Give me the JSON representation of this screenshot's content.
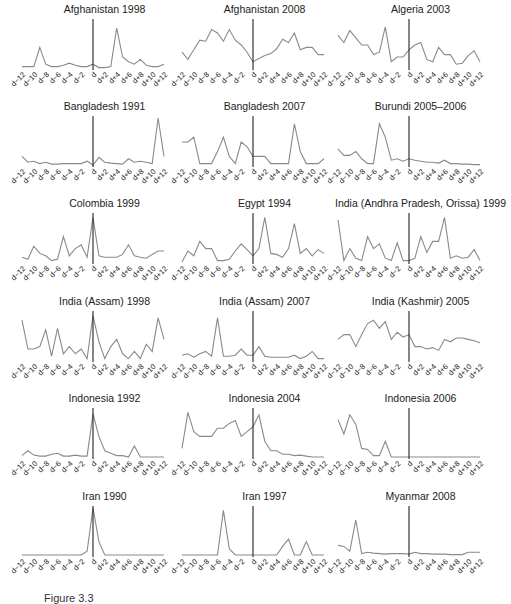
{
  "figure": {
    "caption": "Figure 3.3"
  },
  "x_tick_labels": [
    "d−12",
    "d−10",
    "d−8",
    "d−6",
    "d−4",
    "d−2",
    "d",
    "d+2",
    "d+4",
    "d+6",
    "d+8",
    "d+10",
    "d+12"
  ],
  "colors": {
    "line": "#8a8a8a",
    "event_line": "#222222",
    "text": "#222222"
  },
  "chart_data": [
    {
      "type": "line",
      "title": "Afghanistan 1998",
      "x": [
        "d-12",
        "d-11",
        "d-10",
        "d-9",
        "d-8",
        "d-7",
        "d-6",
        "d-5",
        "d-4",
        "d-3",
        "d-2",
        "d-1",
        "d",
        "d+1",
        "d+2",
        "d+3",
        "d+4",
        "d+5",
        "d+6",
        "d+7",
        "d+8",
        "d+9",
        "d+10",
        "d+11",
        "d+12"
      ],
      "values": [
        0.05,
        0.05,
        0.05,
        0.45,
        0.1,
        0.05,
        0.05,
        0.08,
        0.12,
        0.08,
        0.05,
        0.05,
        0.1,
        0.03,
        0.03,
        0.05,
        0.85,
        0.25,
        0.15,
        0.1,
        0.2,
        0.08,
        0.05,
        0.05,
        0.1
      ],
      "grid": false,
      "event_marker": "d"
    },
    {
      "type": "line",
      "title": "Afghanistan 2008",
      "x": [
        "d-12",
        "d+12"
      ],
      "values": [
        0.35,
        0.2,
        0.4,
        0.6,
        0.58,
        0.82,
        0.75,
        0.58,
        0.82,
        0.6,
        0.5,
        0.35,
        0.15,
        0.22,
        0.28,
        0.32,
        0.42,
        0.62,
        0.55,
        0.75,
        0.4,
        0.45,
        0.45,
        0.3,
        0.3
      ],
      "grid": false,
      "event_marker": "d"
    },
    {
      "type": "line",
      "title": "Algeria 2003",
      "x": [
        "d-12",
        "d+12"
      ],
      "values": [
        0.7,
        0.55,
        0.8,
        0.65,
        0.5,
        0.5,
        0.3,
        0.35,
        0.88,
        0.15,
        0.25,
        0.25,
        0.4,
        0.5,
        0.55,
        0.2,
        0.15,
        0.45,
        0.3,
        0.3,
        0.1,
        0.12,
        0.28,
        0.38,
        0.15
      ],
      "grid": false,
      "event_marker": "d"
    },
    {
      "type": "line",
      "title": "Bangladesh 1991",
      "x": [
        "d-12",
        "d+12"
      ],
      "values": [
        0.2,
        0.08,
        0.1,
        0.05,
        0.08,
        0.04,
        0.04,
        0.05,
        0.05,
        0.05,
        0.05,
        0.1,
        0.02,
        0.18,
        0.08,
        0.06,
        0.05,
        0.04,
        0.15,
        0.08,
        0.1,
        0.08,
        0.05,
        1.0,
        0.2
      ],
      "grid": false,
      "event_marker": "d"
    },
    {
      "type": "line",
      "title": "Bangladesh 2007",
      "x": [
        "d-12",
        "d+12"
      ],
      "values": [
        0.5,
        0.5,
        0.6,
        0.05,
        0.05,
        0.05,
        0.3,
        0.6,
        0.2,
        0.05,
        0.5,
        0.4,
        0.2,
        0.2,
        0.2,
        0.05,
        0.05,
        0.05,
        0.05,
        0.88,
        0.3,
        0.05,
        0.05,
        0.05,
        0.15
      ],
      "grid": false,
      "event_marker": "d"
    },
    {
      "type": "line",
      "title": "Burundi 2005–2006",
      "x": [
        "d-12",
        "d+12"
      ],
      "values": [
        0.35,
        0.22,
        0.22,
        0.3,
        0.15,
        0.05,
        0.05,
        0.88,
        0.6,
        0.12,
        0.15,
        0.1,
        0.15,
        0.12,
        0.1,
        0.08,
        0.08,
        0.06,
        0.12,
        0.05,
        0.05,
        0.04,
        0.04,
        0.03,
        0.03
      ],
      "grid": false,
      "event_marker": "d"
    },
    {
      "type": "line",
      "title": "Colombia 1999",
      "x": [
        "d-12",
        "d+12"
      ],
      "values": [
        0.12,
        0.08,
        0.35,
        0.2,
        0.15,
        0.05,
        0.08,
        0.55,
        0.15,
        0.3,
        0.38,
        0.12,
        0.95,
        0.15,
        0.12,
        0.12,
        0.12,
        0.18,
        0.38,
        0.15,
        0.12,
        0.1,
        0.18,
        0.25,
        0.25
      ],
      "grid": false,
      "event_marker": "d"
    },
    {
      "type": "line",
      "title": "Egypt 1994",
      "x": [
        "d-12",
        "d+12"
      ],
      "values": [
        0.02,
        0.25,
        0.15,
        0.45,
        0.3,
        0.3,
        0.05,
        0.05,
        0.08,
        0.25,
        0.4,
        0.28,
        0.15,
        0.3,
        0.95,
        0.2,
        0.18,
        0.12,
        0.3,
        0.82,
        0.2,
        0.3,
        0.15,
        0.28,
        0.2
      ],
      "grid": false,
      "event_marker": "d"
    },
    {
      "type": "line",
      "title": "India (Andhra Pradesh, Orissa) 1999",
      "x": [
        "d-12",
        "d+12"
      ],
      "values": [
        0.9,
        0.05,
        0.3,
        0.1,
        0.05,
        0.55,
        0.3,
        0.4,
        0.1,
        0.05,
        0.42,
        0.05,
        0.05,
        0.1,
        0.55,
        0.22,
        0.45,
        0.45,
        0.95,
        0.1,
        0.15,
        0.1,
        0.12,
        0.28,
        0.05
      ],
      "grid": false,
      "event_marker": "d"
    },
    {
      "type": "line",
      "title": "India (Assam) 1998",
      "x": [
        "d-12",
        "d+12"
      ],
      "values": [
        0.85,
        0.25,
        0.25,
        0.3,
        0.65,
        0.1,
        0.68,
        0.15,
        0.3,
        0.15,
        0.25,
        0.05,
        0.95,
        0.4,
        0.05,
        0.3,
        0.45,
        0.15,
        0.05,
        0.2,
        0.05,
        0.35,
        0.2,
        0.9,
        0.45
      ],
      "grid": false,
      "event_marker": "d"
    },
    {
      "type": "line",
      "title": "India (Assam) 2007",
      "x": [
        "d-12",
        "d+12"
      ],
      "values": [
        0.12,
        0.15,
        0.08,
        0.15,
        0.2,
        0.1,
        0.9,
        0.1,
        0.1,
        0.12,
        0.25,
        0.12,
        0.12,
        0.3,
        0.1,
        0.08,
        0.08,
        0.08,
        0.08,
        0.12,
        0.05,
        0.1,
        0.2,
        0.05,
        0.05
      ],
      "grid": false,
      "event_marker": "d"
    },
    {
      "type": "line",
      "title": "India (Kashmir) 2005",
      "x": [
        "d-12",
        "d+12"
      ],
      "values": [
        0.45,
        0.55,
        0.55,
        0.3,
        0.55,
        0.78,
        0.85,
        0.68,
        0.82,
        0.45,
        0.6,
        0.5,
        0.55,
        0.3,
        0.3,
        0.25,
        0.28,
        0.22,
        0.45,
        0.4,
        0.48,
        0.48,
        0.45,
        0.42,
        0.38
      ],
      "grid": false,
      "event_marker": "d"
    },
    {
      "type": "line",
      "title": "Indonesia 1992",
      "x": [
        "d-12",
        "d+12"
      ],
      "values": [
        0.05,
        0.15,
        0.06,
        0.04,
        0.04,
        0.08,
        0.1,
        0.04,
        0.04,
        0.06,
        0.04,
        0.04,
        0.92,
        0.45,
        0.15,
        0.1,
        0.05,
        0.05,
        0.02,
        0.25,
        0.02,
        0.02,
        0.02,
        0.02,
        0.02
      ],
      "grid": false,
      "event_marker": "d"
    },
    {
      "type": "line",
      "title": "Indonesia 2004",
      "x": [
        "d-12",
        "d+12"
      ],
      "values": [
        0.2,
        0.95,
        0.55,
        0.45,
        0.45,
        0.45,
        0.62,
        0.62,
        0.72,
        0.78,
        0.45,
        0.55,
        0.65,
        0.9,
        0.35,
        0.15,
        0.15,
        0.08,
        0.08,
        0.05,
        0.06,
        0.04,
        0.02,
        0.02,
        0.02
      ],
      "grid": false,
      "event_marker": "d"
    },
    {
      "type": "line",
      "title": "Indonesia 2006",
      "x": [
        "d-12",
        "d+12"
      ],
      "values": [
        0.8,
        0.5,
        0.9,
        0.7,
        0.2,
        0.18,
        0.05,
        0.05,
        0.35,
        0.02,
        0.02,
        0.02,
        0.02,
        0.02,
        0.02,
        0.02,
        0.02,
        0.02,
        0.02,
        0.02,
        0.02,
        0.02,
        0.02,
        0.02,
        0.02
      ],
      "grid": false,
      "event_marker": "d"
    },
    {
      "type": "line",
      "title": "Iran 1990",
      "x": [
        "d-12",
        "d+12"
      ],
      "values": [
        0.02,
        0.02,
        0.02,
        0.02,
        0.02,
        0.02,
        0.02,
        0.02,
        0.02,
        0.02,
        0.02,
        0.1,
        1.0,
        0.3,
        0.02,
        0.02,
        0.02,
        0.02,
        0.02,
        0.02,
        0.02,
        0.02,
        0.02,
        0.02,
        0.02
      ],
      "grid": false,
      "event_marker": "d"
    },
    {
      "type": "line",
      "title": "Iran 1997",
      "x": [
        "d-12",
        "d+12"
      ],
      "values": [
        0.02,
        0.02,
        0.02,
        0.02,
        0.02,
        0.02,
        0.02,
        0.95,
        0.15,
        0.02,
        0.02,
        0.02,
        0.02,
        0.02,
        0.02,
        0.02,
        0.02,
        0.2,
        0.35,
        0.02,
        0.02,
        0.3,
        0.02,
        0.02,
        0.02
      ],
      "grid": false,
      "event_marker": "d"
    },
    {
      "type": "line",
      "title": "Myanmar 2008",
      "x": [
        "d-12",
        "d+12"
      ],
      "values": [
        0.22,
        0.2,
        0.1,
        0.75,
        0.05,
        0.08,
        0.06,
        0.05,
        0.04,
        0.05,
        0.05,
        0.05,
        0.04,
        0.08,
        0.05,
        0.05,
        0.04,
        0.04,
        0.04,
        0.03,
        0.03,
        0.03,
        0.08,
        0.08,
        0.08
      ],
      "grid": false,
      "event_marker": "d"
    }
  ]
}
